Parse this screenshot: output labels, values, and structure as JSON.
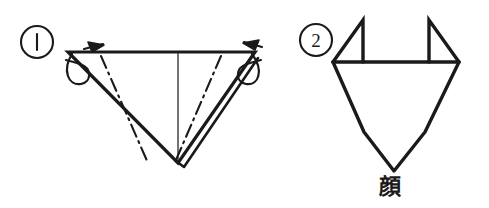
{
  "page": {
    "background_color": "#ffffff",
    "ink_color": "#1a1a1a",
    "width": 489,
    "height": 208
  },
  "steps": [
    {
      "id": "step-1",
      "number_label": "1",
      "circle_marker": "①",
      "description": "Inverted triangle with center vertical crease, two mountain fold dash-dot lines and two curl-back arrows at the top corners",
      "elements": {
        "outline": "inverted-triangle",
        "fold_lines": [
          "dash-dot-left",
          "dash-dot-right"
        ],
        "crease": "center-vertical-line",
        "arrows": [
          "curl-arrow-left",
          "curl-arrow-right"
        ],
        "layer_edge": "double-line-right-flap"
      }
    },
    {
      "id": "step-2",
      "number_label": "2",
      "circle_marker": "②",
      "description": "Resulting cat-face shape with two pointed ears and a tapered chin",
      "caption": "顔",
      "caption_reading": "kao",
      "caption_meaning": "face",
      "elements": {
        "outline": "face-shape",
        "ears": [
          "ear-left",
          "ear-right"
        ]
      }
    }
  ],
  "legend": {
    "dash_dot_meaning": "mountain fold line",
    "solid_meaning": "paper edge",
    "arrow_meaning": "fold direction"
  }
}
